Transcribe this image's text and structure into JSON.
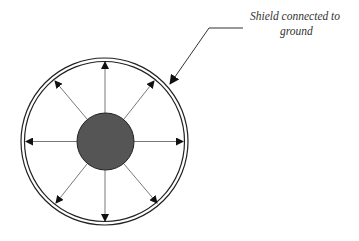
{
  "diagram": {
    "annotation": {
      "line1": "Shield connected to",
      "line2": "ground"
    },
    "colors": {
      "background": "#ffffff",
      "conductor_fill": "#555555",
      "stroke": "#222222",
      "text": "#333333"
    },
    "elements": {
      "shield": {
        "cx": 104.5,
        "cy": 141.5,
        "outer_r": 84,
        "inner_r": 80.5
      },
      "conductor": {
        "cx": 105.5,
        "cy": 141.5,
        "r": 28.5
      },
      "field_arrows": 8,
      "leader_arrow": {
        "from": [
          243,
          28
        ],
        "elbow": [
          209,
          28
        ],
        "to": [
          169,
          85
        ]
      }
    }
  }
}
